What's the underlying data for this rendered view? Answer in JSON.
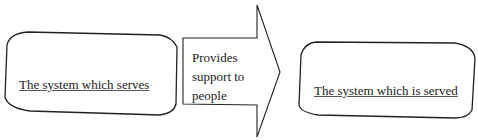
{
  "diagram": {
    "left_box": {
      "label": "The system which serves"
    },
    "arrow": {
      "lines": [
        "Provides",
        "support to",
        "people"
      ]
    },
    "right_box": {
      "label": "The system which is served"
    }
  }
}
